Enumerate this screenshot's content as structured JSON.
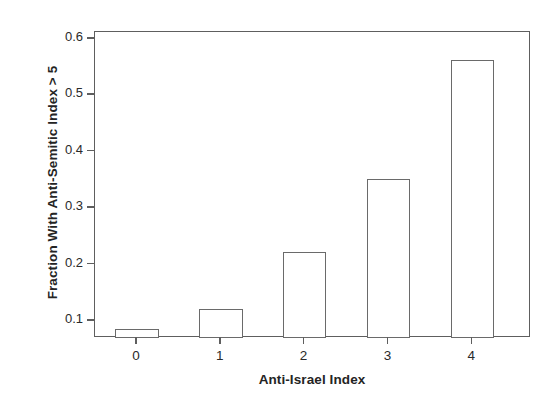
{
  "chart_data": {
    "type": "bar",
    "title": "",
    "xlabel": "Anti-Israel Index",
    "ylabel": "Fraction With Anti-Semitic Index > 5",
    "categories": [
      "0",
      "1",
      "2",
      "3",
      "4"
    ],
    "values": [
      0.086,
      0.122,
      0.223,
      0.351,
      0.562
    ],
    "baseline": 0.07,
    "xlim": [
      -0.5,
      4.7
    ],
    "ylim": [
      0.07,
      0.612
    ],
    "yticks": [
      0.1,
      0.2,
      0.3,
      0.4,
      0.5,
      0.6
    ],
    "ytick_labels": [
      "0.1",
      "0.2",
      "0.3",
      "0.4",
      "0.5",
      "0.6"
    ],
    "xtick_labels": [
      "0",
      "1",
      "2",
      "3",
      "4"
    ],
    "grid": false,
    "legend": null,
    "bar_fill_color": "#ffffff",
    "bar_edge_color": "#6a6a6a",
    "axis_color": "#5e5e5e",
    "background_color": "#ffffff"
  }
}
